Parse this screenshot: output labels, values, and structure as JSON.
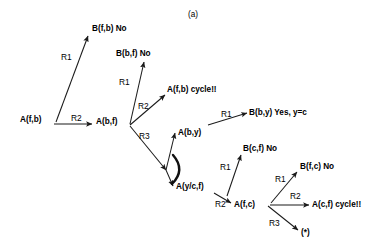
{
  "figure": {
    "caption": "(a)",
    "caption_pos": {
      "x": 188,
      "y": 10
    }
  },
  "colors": {
    "stroke": "#1a1a1a",
    "text": "#000000",
    "background": "#ffffff"
  },
  "nodes": [
    {
      "id": "n-afb",
      "label": "A(f,b)",
      "x": 20,
      "y": 115
    },
    {
      "id": "n-bfb-no",
      "label": "B(f,b)  No",
      "x": 92,
      "y": 24
    },
    {
      "id": "n-abf",
      "label": "A(b,f)",
      "x": 96,
      "y": 117
    },
    {
      "id": "n-bbf-no",
      "label": "B(b,f) No",
      "x": 116,
      "y": 49
    },
    {
      "id": "n-afb-cyc",
      "label": "A(f,b) cycle!!",
      "x": 167,
      "y": 85
    },
    {
      "id": "n-aby",
      "label": "A(b,y)",
      "x": 178,
      "y": 128
    },
    {
      "id": "n-bby-yes",
      "label": "B(b,y) Yes, y=c",
      "x": 249,
      "y": 108
    },
    {
      "id": "n-aycf",
      "label": "A(y/c,f)",
      "x": 176,
      "y": 182
    },
    {
      "id": "n-bcf-no",
      "label": "B(c,f) No",
      "x": 243,
      "y": 144
    },
    {
      "id": "n-afc",
      "label": "A(f,c)",
      "x": 234,
      "y": 200
    },
    {
      "id": "n-bfc-no",
      "label": "B(f,c) No",
      "x": 300,
      "y": 162
    },
    {
      "id": "n-acf-cyc",
      "label": "A(c,f) cycle!!",
      "x": 312,
      "y": 200
    },
    {
      "id": "n-star",
      "label": "(*)",
      "x": 301,
      "y": 228
    }
  ],
  "rule_labels": [
    {
      "id": "r-1",
      "label": "R1",
      "x": 61,
      "y": 52
    },
    {
      "id": "r-2",
      "label": "R2",
      "x": 71,
      "y": 113
    },
    {
      "id": "r-3",
      "label": "R1",
      "x": 119,
      "y": 77
    },
    {
      "id": "r-4",
      "label": "R2",
      "x": 138,
      "y": 101
    },
    {
      "id": "r-5",
      "label": "R3",
      "x": 139,
      "y": 131
    },
    {
      "id": "r-6",
      "label": "R1",
      "x": 221,
      "y": 109
    },
    {
      "id": "r-7",
      "label": "R1",
      "x": 220,
      "y": 162
    },
    {
      "id": "r-8",
      "label": "R2",
      "x": 215,
      "y": 199
    },
    {
      "id": "r-9",
      "label": "R1",
      "x": 275,
      "y": 174
    },
    {
      "id": "r-10",
      "label": "R2",
      "x": 290,
      "y": 191
    },
    {
      "id": "r-11",
      "label": "R3",
      "x": 269,
      "y": 218
    }
  ],
  "edges": [
    {
      "id": "e-afb-bfb",
      "from": "A(f,b)",
      "to": "B(f,b) No",
      "rule": "R1",
      "d": "M 56,122 L 88,36"
    },
    {
      "id": "e-afb-abf",
      "from": "A(f,b)",
      "to": "A(b,f)",
      "rule": "R2",
      "d": "M 54,124 L 92,124"
    },
    {
      "id": "e-abf-bbf",
      "from": "A(b,f)",
      "to": "B(b,f) No",
      "rule": "R1",
      "d": "M 130,124 L 144,62"
    },
    {
      "id": "e-abf-afbc",
      "from": "A(b,f)",
      "to": "A(f,b) cycle!!",
      "rule": "R2",
      "d": "M 130,125 L 165,95"
    },
    {
      "id": "e-abf-split",
      "from": "A(b,f)",
      "to": "branch-point",
      "rule": "R3",
      "d": "M 130,126 L 166,170"
    },
    {
      "id": "e-split-aby",
      "from": "branch-point",
      "to": "A(b,y)",
      "rule": "",
      "d": "M 166,170 L 175,133"
    },
    {
      "id": "e-split-ayc",
      "from": "branch-point",
      "to": "A(y/c,f)",
      "rule": "",
      "d": "M 166,170 L 173,186"
    },
    {
      "id": "e-aby-bby",
      "from": "A(b,y)",
      "to": "B(b,y) Yes, y=c",
      "rule": "R1",
      "d": "M 208,125 L 247,113"
    },
    {
      "id": "e-aycf-bcf",
      "from": "A(y/c,f)",
      "to": "B(c,f) No",
      "rule": "R1",
      "d": "M 227,196 L 241,155"
    },
    {
      "id": "e-aycf-afc",
      "from": "A(y/c,f)",
      "to": "A(f,c)",
      "rule": "R2",
      "d": "M 214,193 L 231,203"
    },
    {
      "id": "e-afc-bfc",
      "from": "A(f,c)",
      "to": "B(f,c) No",
      "rule": "R1",
      "d": "M 271,203 L 297,172"
    },
    {
      "id": "e-afc-acfc",
      "from": "A(f,c)",
      "to": "A(c,f) cycle!!",
      "rule": "R2",
      "d": "M 270,205 L 309,205"
    },
    {
      "id": "e-afc-star",
      "from": "A(f,c)",
      "to": "(*)",
      "rule": "R3",
      "d": "M 268,206 L 298,230"
    }
  ],
  "angle_marker": {
    "id": "angle-arc",
    "d": "M 173,155 Q 186,170 172,184"
  }
}
